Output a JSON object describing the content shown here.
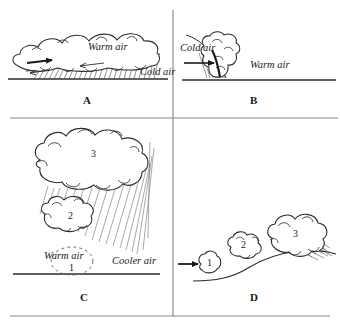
{
  "figure": {
    "type": "line-drawing-diagram",
    "stroke_color": "#2b2b2b",
    "rain_color": "#6e6e6e",
    "frame_color": "#8a8a8a",
    "background": "#ffffff"
  },
  "panels": [
    {
      "id": "A",
      "letter": "A",
      "caption_x": 85,
      "caption_y": 101,
      "description": "warm front - warm air gliding over cold air wedge",
      "labels": [
        {
          "text": "Warm air",
          "x": 88,
          "y": 48
        },
        {
          "text": "Cold air",
          "x": 142,
          "y": 73
        }
      ],
      "arrows": [
        {
          "name": "warm-air-flow-arrow",
          "x1": 27,
          "y1": 63,
          "x2": 52,
          "y2": 60
        }
      ],
      "ground_line": {
        "x1": 8,
        "y1": 79,
        "x2": 168,
        "y2": 79
      }
    },
    {
      "id": "B",
      "letter": "B",
      "caption_x": 253,
      "caption_y": 101,
      "description": "cold front - cold air wedging under warm air",
      "labels": [
        {
          "text": "Cold air",
          "x": 200,
          "y": 49
        },
        {
          "text": "Warm air",
          "x": 288,
          "y": 66
        }
      ],
      "arrows": [
        {
          "name": "cold-air-flow-arrow",
          "x1": 184,
          "y1": 63,
          "x2": 214,
          "y2": 63
        }
      ],
      "ground_line": {
        "x1": 182,
        "y1": 80,
        "x2": 336,
        "y2": 80
      }
    },
    {
      "id": "C",
      "letter": "C",
      "caption_x": 83,
      "caption_y": 298,
      "description": "convergence / convection - warm air rising through cooler air building cumulonimbus",
      "labels": [
        {
          "text": "Warm air",
          "x": 63,
          "y": 258
        },
        {
          "text": "Cooler air",
          "x": 128,
          "y": 263
        }
      ],
      "clouds": [
        {
          "number": "1",
          "x": 65,
          "y": 270,
          "style": "dashed"
        },
        {
          "number": "2",
          "x": 71,
          "y": 217,
          "style": "solid"
        },
        {
          "number": "3",
          "x": 93,
          "y": 153,
          "style": "solid"
        }
      ],
      "ground_line": {
        "x1": 13,
        "y1": 274,
        "x2": 160,
        "y2": 274
      }
    },
    {
      "id": "D",
      "letter": "D",
      "caption_x": 253,
      "caption_y": 298,
      "description": "orographic lifting - air forced up a hill slope forming clouds",
      "labels": [],
      "clouds": [
        {
          "number": "1",
          "x": 209,
          "y": 263,
          "style": "solid"
        },
        {
          "number": "2",
          "x": 243,
          "y": 247,
          "style": "solid"
        },
        {
          "number": "3",
          "x": 291,
          "y": 234,
          "style": "solid"
        }
      ],
      "arrows": [
        {
          "name": "upslope-flow-arrow",
          "x1": 178,
          "y1": 264,
          "x2": 198,
          "y2": 264
        }
      ]
    }
  ],
  "dividers": {
    "vertical": {
      "x": 173,
      "y1": 10,
      "y2": 316
    },
    "horizontal": {
      "y": 118,
      "x1": 10,
      "x2": 338
    },
    "bottom": {
      "y": 316,
      "x1": 10,
      "x2": 330
    }
  }
}
